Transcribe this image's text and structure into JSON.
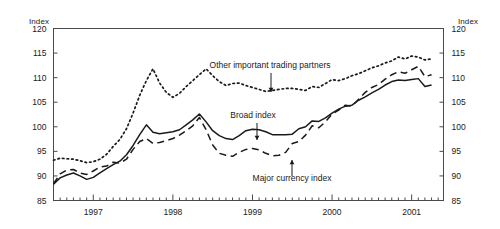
{
  "figure": {
    "left_axis_unit": "Index",
    "right_axis_unit": "Index"
  },
  "chart_data": {
    "type": "line",
    "title": "",
    "subtitle": "",
    "xlabel": "",
    "ylabel": "Index",
    "y2label": "Index",
    "ylim": [
      85,
      120
    ],
    "yticks": [
      85,
      90,
      95,
      100,
      105,
      110,
      115,
      120
    ],
    "yticklabels": [
      "85",
      "90",
      "95",
      "100",
      "105",
      "110",
      "115",
      "120"
    ],
    "y2ticks": [
      85,
      90,
      95,
      100,
      105,
      110,
      115,
      120
    ],
    "y2ticklabels": [
      "85",
      "90",
      "95",
      "100",
      "105",
      "110",
      "115",
      "120"
    ],
    "grid": false,
    "legend_position": "inline-annotations",
    "xlim": [
      1996.5,
      2001.4
    ],
    "xticks": [
      1997,
      1998,
      1999,
      2000,
      2001
    ],
    "xticklabels": [
      "1997",
      "1998",
      "1999",
      "2000",
      "2001"
    ],
    "x_minor_tick_interval": 0.08333,
    "x_minor_tick_note": "monthly minor ticks between labeled year ticks",
    "x": [
      1996.5,
      1996.583,
      1996.667,
      1996.75,
      1996.833,
      1996.917,
      1997.0,
      1997.083,
      1997.167,
      1997.25,
      1997.333,
      1997.417,
      1997.5,
      1997.583,
      1997.667,
      1997.75,
      1997.833,
      1997.917,
      1998.0,
      1998.083,
      1998.167,
      1998.25,
      1998.333,
      1998.417,
      1998.5,
      1998.583,
      1998.667,
      1998.75,
      1998.833,
      1998.917,
      1999.0,
      1999.083,
      1999.167,
      1999.25,
      1999.333,
      1999.417,
      1999.5,
      1999.583,
      1999.667,
      1999.75,
      1999.833,
      1999.917,
      2000.0,
      2000.083,
      2000.167,
      2000.25,
      2000.333,
      2000.417,
      2000.5,
      2000.583,
      2000.667,
      2000.75,
      2000.833,
      2000.917,
      2001.0,
      2001.083,
      2001.167,
      2001.25
    ],
    "series": [
      {
        "name": "Broad index",
        "style": "solid",
        "color": "#1a1a1a",
        "values": [
          88.3,
          89.6,
          90.2,
          90.6,
          90.0,
          89.3,
          89.7,
          90.6,
          91.5,
          92.3,
          93.0,
          94.3,
          96.2,
          98.4,
          100.4,
          98.9,
          98.6,
          98.8,
          99.0,
          99.4,
          100.4,
          101.4,
          102.6,
          101.0,
          99.2,
          98.2,
          97.6,
          97.4,
          98.2,
          99.2,
          99.5,
          99.4,
          99.0,
          98.4,
          98.4,
          98.4,
          98.5,
          99.6,
          100.0,
          101.2,
          101.1,
          101.8,
          102.8,
          103.6,
          104.2,
          104.4,
          105.4,
          106.1,
          106.9,
          107.6,
          108.5,
          109.2,
          109.5,
          109.4,
          109.6,
          109.8,
          108.2,
          108.5
        ]
      },
      {
        "name": "Major currency index",
        "style": "dashed",
        "color": "#1a1a1a",
        "values": [
          88.4,
          90.4,
          91.2,
          91.3,
          90.6,
          90.3,
          91.0,
          91.8,
          92.0,
          92.8,
          92.6,
          93.4,
          95.4,
          97.0,
          97.6,
          96.6,
          96.8,
          97.2,
          97.6,
          98.3,
          99.2,
          100.2,
          101.9,
          99.4,
          96.3,
          94.6,
          94.2,
          94.0,
          94.8,
          95.4,
          95.6,
          95.3,
          94.6,
          94.1,
          94.2,
          94.8,
          96.6,
          97.0,
          98.3,
          100.2,
          99.8,
          101.0,
          102.6,
          103.4,
          104.4,
          104.2,
          105.6,
          107.0,
          108.0,
          108.6,
          109.7,
          110.6,
          111.2,
          110.9,
          111.6,
          112.3,
          110.2,
          110.6
        ]
      },
      {
        "name": "Other important trading partners",
        "style": "dotted",
        "color": "#1a1a1a",
        "values": [
          93.2,
          93.6,
          93.5,
          93.4,
          93.1,
          92.7,
          92.9,
          93.4,
          94.4,
          96.0,
          97.4,
          99.6,
          102.8,
          106.4,
          109.4,
          111.8,
          108.9,
          107.0,
          106.0,
          106.8,
          108.2,
          109.4,
          110.6,
          111.8,
          110.4,
          109.2,
          108.4,
          108.8,
          108.9,
          108.4,
          108.0,
          107.6,
          107.2,
          107.4,
          107.6,
          107.8,
          107.8,
          107.6,
          107.4,
          108.2,
          108.0,
          108.8,
          109.6,
          109.4,
          109.8,
          110.4,
          110.8,
          111.4,
          112.0,
          112.4,
          113.0,
          113.4,
          114.2,
          113.8,
          114.4,
          114.2,
          113.6,
          113.8
        ]
      }
    ],
    "annotations": [
      {
        "name": "other-important-trading-partners",
        "text": "Other important trading partners",
        "label_x": 270,
        "label_y": 68,
        "arrow_from_x": 271,
        "arrow_from_y": 73,
        "arrow_to_x": 271,
        "arrow_to_y": 92,
        "arrow_direction": "down"
      },
      {
        "name": "broad-index",
        "text": "Broad index",
        "label_x": 253,
        "label_y": 118,
        "arrow_from_x": 257,
        "arrow_from_y": 123,
        "arrow_to_x": 257,
        "arrow_to_y": 140,
        "arrow_direction": "down"
      },
      {
        "name": "major-currency-index",
        "text": "Major currency index",
        "label_x": 292,
        "label_y": 181,
        "arrow_from_x": 292,
        "arrow_from_y": 176,
        "arrow_to_x": 292,
        "arrow_to_y": 160,
        "arrow_direction": "up"
      }
    ]
  }
}
